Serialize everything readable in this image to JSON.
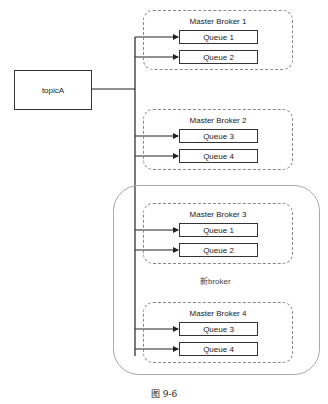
{
  "diagram": {
    "topic": {
      "label": "topicA"
    },
    "brokers": [
      {
        "title": "Master Broker 1",
        "queues": [
          "Queue 1",
          "Queue 2"
        ]
      },
      {
        "title": "Master Broker 2",
        "queues": [
          "Queue 3",
          "Queue 4"
        ]
      },
      {
        "title": "Master Broker 3",
        "queues": [
          "Queue 1",
          "Queue 2"
        ]
      },
      {
        "title": "Master Broker 4",
        "queues": [
          "Queue 3",
          "Queue 4"
        ]
      }
    ],
    "new_group_label": "新broker",
    "caption": "图 9-6"
  }
}
